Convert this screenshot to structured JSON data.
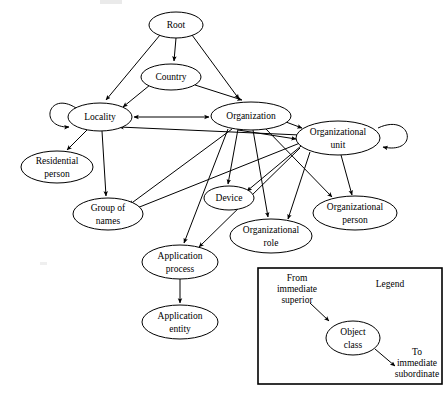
{
  "diagram": {
    "type": "directed-graph",
    "width": 448,
    "height": 412,
    "background_color": "#ffffff",
    "stroke_color": "#000000",
    "nodes": [
      {
        "id": "root",
        "label": "Root",
        "cx": 176,
        "cy": 25,
        "rx": 27,
        "ry": 13,
        "lines": [
          "Root"
        ]
      },
      {
        "id": "country",
        "label": "Country",
        "cx": 171,
        "cy": 77,
        "rx": 30,
        "ry": 13,
        "lines": [
          "Country"
        ]
      },
      {
        "id": "locality",
        "label": "Locality",
        "cx": 100,
        "cy": 117,
        "rx": 32,
        "ry": 14,
        "lines": [
          "Locality"
        ],
        "self_loop": "left"
      },
      {
        "id": "organization",
        "label": "Organization",
        "cx": 251,
        "cy": 116,
        "rx": 40,
        "ry": 14,
        "lines": [
          "Organization"
        ]
      },
      {
        "id": "organizational-unit",
        "label": "Organizational unit",
        "cx": 338,
        "cy": 138,
        "rx": 42,
        "ry": 17,
        "lines": [
          "Organizational",
          "unit"
        ],
        "self_loop": "right"
      },
      {
        "id": "residential-person",
        "label": "Residential person",
        "cx": 57,
        "cy": 167,
        "rx": 36,
        "ry": 16,
        "lines": [
          "Residential",
          "person"
        ]
      },
      {
        "id": "group-of-names",
        "label": "Group of names",
        "cx": 108,
        "cy": 214,
        "rx": 35,
        "ry": 16,
        "lines": [
          "Group of",
          "names"
        ]
      },
      {
        "id": "device",
        "label": "Device",
        "cx": 229,
        "cy": 198,
        "rx": 25,
        "ry": 12,
        "lines": [
          "Device"
        ]
      },
      {
        "id": "organizational-role",
        "label": "Organizational role",
        "cx": 271,
        "cy": 236,
        "rx": 41,
        "ry": 17,
        "lines": [
          "Organizational",
          "role"
        ]
      },
      {
        "id": "organizational-person",
        "label": "Organizational person",
        "cx": 355,
        "cy": 213,
        "rx": 42,
        "ry": 17,
        "lines": [
          "Organizational",
          "person"
        ]
      },
      {
        "id": "application-process",
        "label": "Application process",
        "cx": 180,
        "cy": 262,
        "rx": 38,
        "ry": 17,
        "lines": [
          "Application",
          "process"
        ]
      },
      {
        "id": "application-entity",
        "label": "Application entity",
        "cx": 180,
        "cy": 322,
        "rx": 38,
        "ry": 17,
        "lines": [
          "Application",
          "entity"
        ]
      }
    ],
    "edges": [
      {
        "from": "root",
        "to": "locality"
      },
      {
        "from": "root",
        "to": "country"
      },
      {
        "from": "root",
        "to": "organization"
      },
      {
        "from": "country",
        "to": "locality"
      },
      {
        "from": "country",
        "to": "organization"
      },
      {
        "from": "locality",
        "to": "locality"
      },
      {
        "from": "locality",
        "to": "organization"
      },
      {
        "from": "locality",
        "to": "residential-person"
      },
      {
        "from": "locality",
        "to": "group-of-names"
      },
      {
        "from": "organization",
        "to": "locality"
      },
      {
        "from": "organization",
        "to": "organizational-unit"
      },
      {
        "from": "organization",
        "to": "group-of-names"
      },
      {
        "from": "organization",
        "to": "device"
      },
      {
        "from": "organization",
        "to": "organizational-role"
      },
      {
        "from": "organization",
        "to": "organizational-person"
      },
      {
        "from": "organization",
        "to": "application-process"
      },
      {
        "from": "organizational-unit",
        "to": "organizational-unit"
      },
      {
        "from": "organizational-unit",
        "to": "locality"
      },
      {
        "from": "organizational-unit",
        "to": "group-of-names"
      },
      {
        "from": "organizational-unit",
        "to": "device"
      },
      {
        "from": "organizational-unit",
        "to": "organizational-role"
      },
      {
        "from": "organizational-unit",
        "to": "organizational-person"
      },
      {
        "from": "organizational-unit",
        "to": "application-process"
      },
      {
        "from": "application-process",
        "to": "application-entity"
      }
    ]
  },
  "legend": {
    "title": "Legend",
    "from_label": [
      "From",
      "immediate",
      "superior"
    ],
    "from_label_text": "From immediate superior",
    "to_label": [
      "To",
      "immediate",
      "subordinate"
    ],
    "to_label_text": "To immediate subordinate",
    "object_class_label": [
      "Object",
      "class"
    ],
    "object_class_text": "Object class",
    "box": {
      "x": 258,
      "y": 268,
      "width": 184,
      "height": 116
    }
  }
}
